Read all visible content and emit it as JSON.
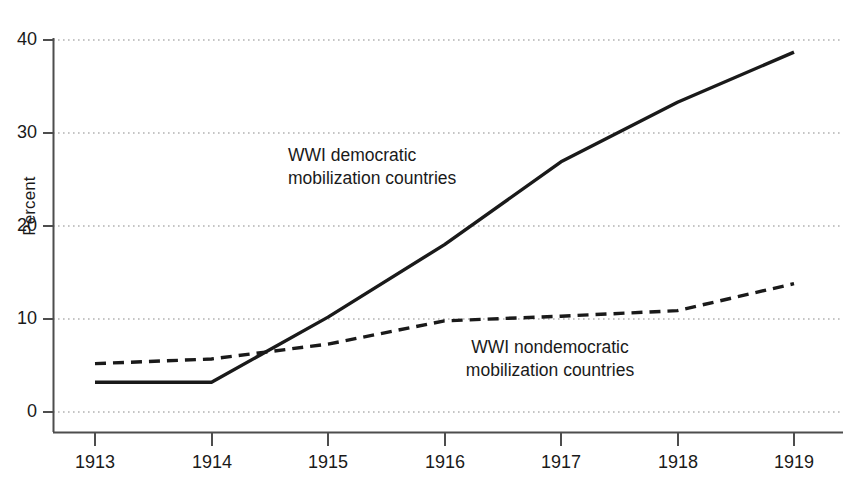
{
  "chart_data": {
    "type": "line",
    "title": "",
    "xlabel": "",
    "ylabel": "Percent",
    "x": [
      1913,
      1914,
      1915,
      1916,
      1917,
      1918,
      1919
    ],
    "xtick_labels": [
      "1913",
      "1914",
      "1915",
      "1916",
      "1917",
      "1918",
      "1919"
    ],
    "ytick_labels": [
      "0",
      "10",
      "20",
      "30",
      "40"
    ],
    "ytick_values": [
      0,
      10,
      20,
      30,
      40
    ],
    "ylim": [
      0,
      40
    ],
    "xlim": [
      1913,
      1919
    ],
    "grid": "horizontal-dotted",
    "legend": "inline-annotations",
    "series": [
      {
        "name": "WWI democratic mobilization countries",
        "style": "solid",
        "color": "#1a1a1a",
        "values": [
          3.2,
          3.2,
          10.2,
          18.0,
          26.9,
          33.3,
          38.7
        ]
      },
      {
        "name": "WWI nondemocratic mobilization countries",
        "style": "dashed",
        "color": "#1a1a1a",
        "values": [
          5.2,
          5.7,
          7.3,
          9.8,
          10.3,
          10.9,
          13.8
        ]
      }
    ],
    "annotations": [
      {
        "name": "democratic-label",
        "line1": "WWI democratic",
        "line2": "mobilization countries"
      },
      {
        "name": "nondemocratic-label",
        "line1": "WWI nondemocratic",
        "line2": "mobilization countries"
      }
    ]
  }
}
